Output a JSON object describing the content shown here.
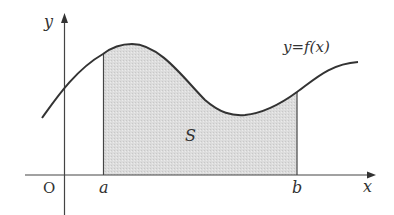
{
  "diagram": {
    "type": "definite-integral-area",
    "labels": {
      "y_axis": "y",
      "x_axis": "x",
      "origin": "O",
      "lower_bound": "a",
      "upper_bound": "b",
      "region": "S",
      "curve": "y=f(x)"
    },
    "colors": {
      "stroke": "#333333",
      "fill": "#d9d9d9",
      "background": "#ffffff"
    }
  }
}
